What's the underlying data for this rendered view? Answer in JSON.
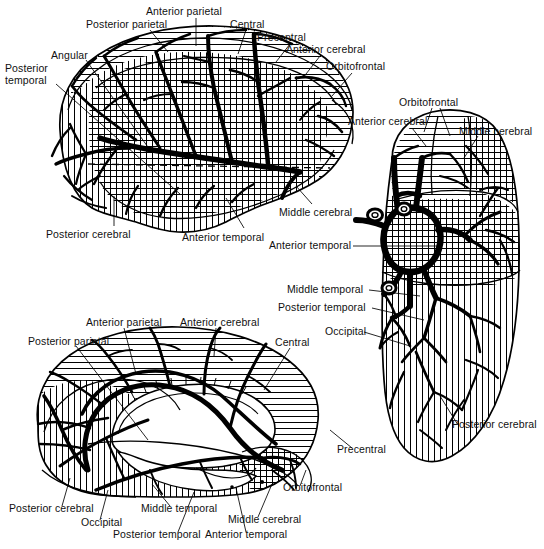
{
  "figure": {
    "background_color": "#ffffff",
    "ink_color": "#000000",
    "views": [
      {
        "id": "lateral",
        "name": "Lateral view of cerebral hemisphere",
        "position": "top-left"
      },
      {
        "id": "inferior",
        "name": "Inferior (basal) view of cerebral hemispheres with circle of Willis",
        "position": "right"
      },
      {
        "id": "medial",
        "name": "Medial view of cerebral hemisphere",
        "position": "bottom-left"
      }
    ],
    "territory_patterns": [
      {
        "artery": "Anterior cerebral",
        "pattern": "horizontal-hatch"
      },
      {
        "artery": "Middle cerebral",
        "pattern": "cross-hatch"
      },
      {
        "artery": "Posterior cerebral",
        "pattern": "vertical-hatch"
      }
    ]
  },
  "labels": {
    "lateral": [
      {
        "id": "lat-posterior-parietal",
        "text": "Posterior parietal",
        "x": 86,
        "y": 19,
        "lines": 1
      },
      {
        "id": "lat-anterior-parietal",
        "text": "Anterior parietal",
        "x": 146,
        "y": 6,
        "lines": 1
      },
      {
        "id": "lat-central",
        "text": "Central",
        "x": 230,
        "y": 19,
        "lines": 1
      },
      {
        "id": "lat-precentral",
        "text": "Precentral",
        "x": 257,
        "y": 32,
        "lines": 1
      },
      {
        "id": "lat-anterior-cerebral",
        "text": "Anterior cerebral",
        "x": 286,
        "y": 44,
        "lines": 1
      },
      {
        "id": "lat-orbitofrontal",
        "text": "Orbitofrontal",
        "x": 326,
        "y": 61,
        "lines": 1
      },
      {
        "id": "lat-angular",
        "text": "Angular",
        "x": 51,
        "y": 50,
        "lines": 1
      },
      {
        "id": "lat-posterior-temporal",
        "text": "Posterior temporal",
        "x": 5,
        "y": 62,
        "lines": 2
      },
      {
        "id": "lat-posterior-cerebral",
        "text": "Posterior cerebral",
        "x": 46,
        "y": 229,
        "lines": 1
      },
      {
        "id": "lat-anterior-temporal",
        "text": "Anterior temporal",
        "x": 182,
        "y": 232,
        "lines": 1
      },
      {
        "id": "lat-middle-cerebral",
        "text": "Middle cerebral",
        "x": 279,
        "y": 207,
        "lines": 1
      }
    ],
    "inferior": [
      {
        "id": "inf-orbitofrontal",
        "text": "Orbitofrontal",
        "x": 399,
        "y": 97,
        "lines": 1
      },
      {
        "id": "inf-anterior-cerebral",
        "text": "Anterior cerebral",
        "x": 348,
        "y": 116,
        "lines": 1
      },
      {
        "id": "inf-middle-cerebral",
        "text": "Middle cerebral",
        "x": 459,
        "y": 126,
        "lines": 1
      },
      {
        "id": "inf-anterior-temporal",
        "text": "Anterior temporal",
        "x": 269,
        "y": 246,
        "lines": 1
      },
      {
        "id": "inf-middle-temporal",
        "text": "Middle temporal",
        "x": 287,
        "y": 292,
        "lines": 1
      },
      {
        "id": "inf-posterior-temporal",
        "text": "Posterior temporal",
        "x": 278,
        "y": 309,
        "lines": 1
      },
      {
        "id": "inf-occipital",
        "text": "Occipital",
        "x": 325,
        "y": 333,
        "lines": 1
      },
      {
        "id": "inf-posterior-cerebral",
        "text": "Posterior cerebral",
        "x": 452,
        "y": 429,
        "lines": 1
      }
    ],
    "medial": [
      {
        "id": "med-anterior-parietal",
        "text": "Anterior parietal",
        "x": 86,
        "y": 317,
        "lines": 1
      },
      {
        "id": "med-anterior-cerebral",
        "text": "Anterior cerebral",
        "x": 180,
        "y": 317,
        "lines": 1
      },
      {
        "id": "med-posterior-parietal",
        "text": "Posterior parietal",
        "x": 28,
        "y": 336,
        "lines": 1
      },
      {
        "id": "med-central",
        "text": "Central",
        "x": 275,
        "y": 337,
        "lines": 1
      },
      {
        "id": "med-precentral",
        "text": "Precentral",
        "x": 337,
        "y": 450,
        "lines": 1
      },
      {
        "id": "med-orbitofrontal",
        "text": "Orbitofrontal",
        "x": 283,
        "y": 489,
        "lines": 1
      },
      {
        "id": "med-posterior-cerebral",
        "text": "Posterior cerebral",
        "x": 9,
        "y": 509,
        "lines": 1
      },
      {
        "id": "med-occipital",
        "text": "Occipital",
        "x": 81,
        "y": 523,
        "lines": 1
      },
      {
        "id": "med-middle-temporal",
        "text": "Middle temporal",
        "x": 141,
        "y": 509,
        "lines": 1
      },
      {
        "id": "med-posterior-temporal",
        "text": "Posterior temporal",
        "x": 113,
        "y": 535,
        "lines": 1
      },
      {
        "id": "med-anterior-temporal",
        "text": "Anterior temporal",
        "x": 205,
        "y": 535,
        "lines": 1
      },
      {
        "id": "med-middle-cerebral",
        "text": "Middle cerebral",
        "x": 228,
        "y": 520,
        "lines": 1
      }
    ]
  }
}
